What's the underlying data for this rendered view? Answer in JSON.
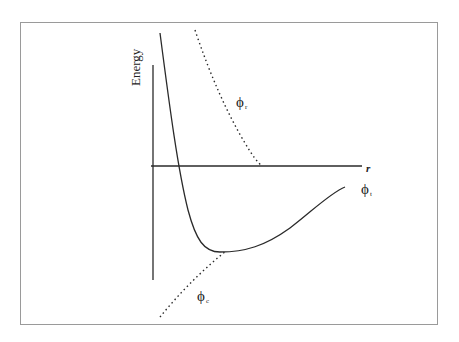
{
  "diagram": {
    "axes": {
      "y_label": "Energy",
      "x_label": "r"
    },
    "curves": [
      {
        "id": "phi_t",
        "symbol": "ϕ",
        "subscript": "t",
        "style": "solid",
        "description": "total potential energy (well with minimum)"
      },
      {
        "id": "phi_r",
        "symbol": "ϕ",
        "subscript": "r",
        "style": "dotted",
        "description": "repulsive energy"
      },
      {
        "id": "phi_c",
        "symbol": "ϕ",
        "subscript": "c",
        "style": "dotted",
        "description": "attractive (cohesive) energy"
      }
    ],
    "colors": {
      "line": "#2a2a2a",
      "frame": "#9a9a9a",
      "background": "#ffffff"
    }
  }
}
